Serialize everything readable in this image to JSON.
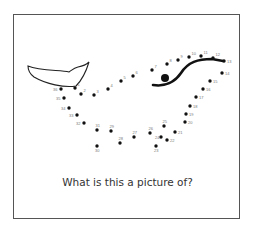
{
  "puzzle": {
    "question": "What is this a picture of?",
    "colors": {
      "dot": "#111111",
      "line": "#111111",
      "label": "#777777",
      "frame": "#555555"
    },
    "eye": {
      "x": 165,
      "y": 78,
      "r": 4
    },
    "dots": [
      {
        "n": "1",
        "x": 75,
        "y": 88
      },
      {
        "n": "2",
        "x": 81,
        "y": 94
      },
      {
        "n": "3",
        "x": 94,
        "y": 95
      },
      {
        "n": "4",
        "x": 108,
        "y": 89
      },
      {
        "n": "5",
        "x": 121,
        "y": 81
      },
      {
        "n": "6",
        "x": 133,
        "y": 76
      },
      {
        "n": "7",
        "x": 152,
        "y": 70
      },
      {
        "n": "8",
        "x": 167,
        "y": 64
      },
      {
        "n": "9",
        "x": 178,
        "y": 60
      },
      {
        "n": "10",
        "x": 189,
        "y": 57
      },
      {
        "n": "11",
        "x": 201,
        "y": 56
      },
      {
        "n": "12",
        "x": 213,
        "y": 58
      },
      {
        "n": "13",
        "x": 224,
        "y": 61
      },
      {
        "n": "14",
        "x": 222,
        "y": 73
      },
      {
        "n": "15",
        "x": 210,
        "y": 81
      },
      {
        "n": "16",
        "x": 203,
        "y": 89
      },
      {
        "n": "17",
        "x": 196,
        "y": 97
      },
      {
        "n": "18",
        "x": 190,
        "y": 106
      },
      {
        "n": "19",
        "x": 186,
        "y": 114
      },
      {
        "n": "20",
        "x": 185,
        "y": 122
      },
      {
        "n": "21",
        "x": 175,
        "y": 132
      },
      {
        "n": "22",
        "x": 167,
        "y": 140
      },
      {
        "n": "23",
        "x": 156,
        "y": 146
      },
      {
        "n": "24",
        "x": 161,
        "y": 137
      },
      {
        "n": "25",
        "x": 164,
        "y": 126
      },
      {
        "n": "26",
        "x": 150,
        "y": 133
      },
      {
        "n": "27",
        "x": 134,
        "y": 137
      },
      {
        "n": "28",
        "x": 120,
        "y": 143
      },
      {
        "n": "29",
        "x": 111,
        "y": 131
      },
      {
        "n": "30",
        "x": 97,
        "y": 146
      },
      {
        "n": "31",
        "x": 97,
        "y": 130
      },
      {
        "n": "32",
        "x": 84,
        "y": 123
      },
      {
        "n": "33",
        "x": 77,
        "y": 115
      },
      {
        "n": "34",
        "x": 69,
        "y": 108
      },
      {
        "n": "35",
        "x": 64,
        "y": 98
      },
      {
        "n": "36",
        "x": 61,
        "y": 89
      }
    ]
  }
}
